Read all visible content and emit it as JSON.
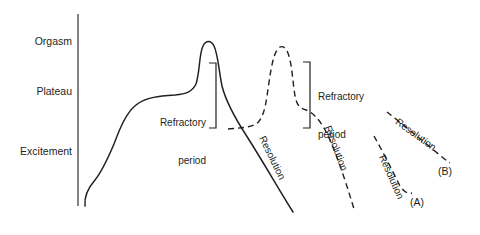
{
  "figure": {
    "background_color": "#ffffff",
    "stroke_color": "#231f20",
    "text_color": "#231f20",
    "axis": {
      "name": "vertical-axis",
      "labels": [
        {
          "text": "Orgasm",
          "x": 30,
          "y": 35
        },
        {
          "text": "Plateau",
          "x": 30,
          "y": 85
        },
        {
          "text": "Excitement",
          "x": 14,
          "y": 145
        }
      ]
    },
    "brackets": [
      {
        "id": "refractory-1",
        "label_line1": "Refractory",
        "label_line2": "period",
        "label_x": 148,
        "label_y": 92,
        "align": "right"
      },
      {
        "id": "refractory-2",
        "label_line1": "Refractory",
        "label_line2": "period",
        "label_x": 318,
        "label_y": 66,
        "align": "left"
      }
    ],
    "curve_labels": [
      {
        "text": "Resolution",
        "x": 267,
        "y": 134,
        "rotate": 64
      },
      {
        "text": "Resolution",
        "x": 333,
        "y": 124,
        "rotate": 69
      },
      {
        "text": "Resolution",
        "x": 387,
        "y": 153,
        "rotate": 66
      },
      {
        "text": "Resolution",
        "x": 400,
        "y": 116,
        "rotate": 36
      }
    ],
    "panel_labels": [
      {
        "text": "(A)",
        "x": 410,
        "y": 198
      },
      {
        "text": "(B)",
        "x": 438,
        "y": 167
      }
    ]
  },
  "chart_data": {
    "type": "line",
    "xlabel": "",
    "ylabel": "",
    "grid": false,
    "legend": "none",
    "y_tick_labels": [
      "Excitement",
      "Plateau",
      "Orgasm"
    ],
    "y_tick_pixel_y": [
      152,
      92,
      42
    ],
    "axis_pixel": {
      "x": 78,
      "y_top": 14,
      "y_bottom": 206
    },
    "annotations": [
      "Refractory period",
      "Refractory period",
      "Resolution",
      "Resolution",
      "Resolution",
      "Resolution",
      "(A)",
      "(B)"
    ],
    "series": [
      {
        "name": "primary-response-solid",
        "style": "solid",
        "path": "M 85 206 C 84 196 88 188 95 180 C 103 170 108 158 114 144 C 120 128 126 113 136 105 C 146 97 160 96 175 95 C 186 94 192 92 196 84 C 200 72 199 54 203 46 C 206 40 211 40 214 46 C 218 54 219 72 222 86 C 226 102 235 118 246 135 C 262 160 278 188 293 212"
      },
      {
        "name": "secondary-response-dashed",
        "style": "dashed",
        "path": "M 228 129 C 238 128 248 128 256 124 C 262 120 265 110 267 96 C 270 76 272 58 277 50 C 281 44 286 46 289 56 C 292 66 293 84 295 96 C 297 106 300 108 306 110 C 312 112 318 118 324 128 C 334 146 344 176 354 209"
      },
      {
        "name": "resolution-line-A",
        "style": "dashed",
        "path": "M 374 136 C 382 150 392 170 400 186 C 404 192 408 194 412 193"
      },
      {
        "name": "resolution-line-B",
        "style": "dashed",
        "path": "M 387 112 C 400 122 418 137 436 152 C 442 157 447 161 450 163"
      }
    ]
  }
}
